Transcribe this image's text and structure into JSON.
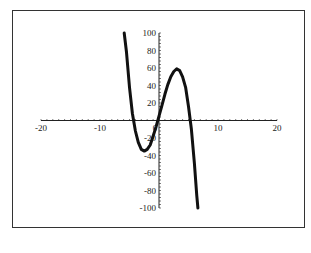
{
  "chart_data": {
    "type": "line",
    "title": "",
    "xlabel": "",
    "ylabel": "",
    "xlim": [
      -20,
      20
    ],
    "ylim": [
      -100,
      100
    ],
    "x_ticks": [
      "-20",
      "-10",
      "0",
      "10",
      "20"
    ],
    "y_ticks": [
      "100",
      "80",
      "60",
      "40",
      "20",
      "-20",
      "-40",
      "-60",
      "-80",
      "-100"
    ],
    "grid": false,
    "legend": null,
    "series": [
      {
        "name": "cubic curve",
        "x": [
          -5.9,
          -5.5,
          -5,
          -4.5,
          -4,
          -3.5,
          -3,
          -2.5,
          -2,
          -1.5,
          -1,
          -0.5,
          0,
          0.5,
          1,
          1.5,
          2,
          2.5,
          3,
          3.5,
          4,
          4.5,
          5,
          5.5,
          6,
          6.4
        ],
        "y": [
          100,
          78,
          38,
          8,
          -12,
          -25,
          -33,
          -35,
          -33,
          -28,
          -18,
          -7,
          5,
          17,
          30,
          41,
          50,
          56,
          59,
          57,
          50,
          38,
          16,
          -10,
          -49,
          -86
        ]
      }
    ],
    "line_color": "#111111"
  }
}
